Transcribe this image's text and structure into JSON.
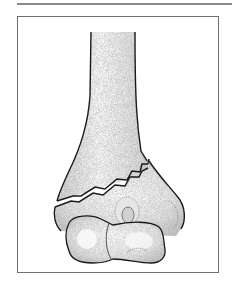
{
  "figure": {
    "colors": {
      "outline": "#1a1a1a",
      "bone_fill": "#ededed",
      "stipple": "#9a9a9a",
      "frame_border": "#6f6f6f",
      "top_rule": "#8a8a8a",
      "background": "#ffffff"
    }
  }
}
